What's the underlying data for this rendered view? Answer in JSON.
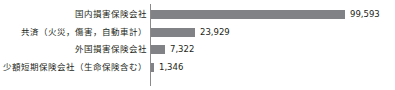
{
  "chart_data": {
    "type": "bar",
    "orientation": "horizontal",
    "title": "",
    "xlabel": "",
    "ylabel": "",
    "grid": false,
    "legend": false,
    "axis_color": "#8a8a8a",
    "bar_color": "#808285",
    "text_color": "#231f20",
    "xlim": [
      0,
      99593
    ],
    "categories": [
      "国内損害保険会社",
      "共済（火災，傷害，自動車計）",
      "外国損害保険会社",
      "少額短期保険会社（生命保険含む）"
    ],
    "values": [
      99593,
      23929,
      7322,
      1346
    ],
    "value_labels": [
      "99,593",
      "23,929",
      "7,322",
      "1,346"
    ],
    "bar_pixel_lengths": [
      194,
      44,
      14,
      3
    ]
  }
}
